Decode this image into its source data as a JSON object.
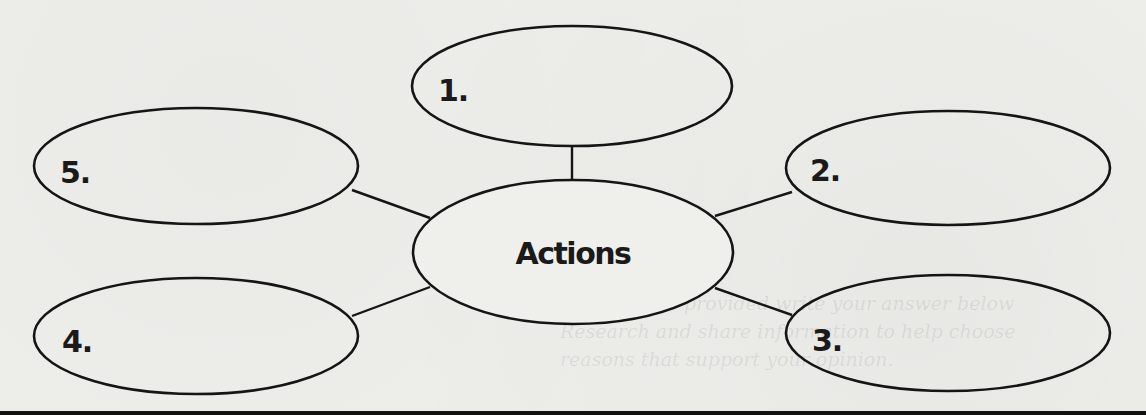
{
  "diagram": {
    "type": "concept-web",
    "center": {
      "label": "Actions",
      "cx": 573,
      "cy": 252,
      "rx": 160,
      "ry": 72
    },
    "nodes": [
      {
        "label": "1.",
        "cx": 572,
        "cy": 86,
        "rx": 160,
        "ry": 60
      },
      {
        "label": "2.",
        "cx": 948,
        "cy": 168,
        "rx": 162,
        "ry": 57
      },
      {
        "label": "3.",
        "cx": 948,
        "cy": 333,
        "rx": 162,
        "ry": 58
      },
      {
        "label": "4.",
        "cx": 196,
        "cy": 336,
        "rx": 162,
        "ry": 58
      },
      {
        "label": "5.",
        "cx": 196,
        "cy": 166,
        "rx": 162,
        "ry": 58
      }
    ],
    "connectors": [
      {
        "from": "1.",
        "to": "Actions"
      },
      {
        "from": "2.",
        "to": "Actions"
      },
      {
        "from": "3.",
        "to": "Actions"
      },
      {
        "from": "4.",
        "to": "Actions"
      },
      {
        "from": "5.",
        "to": "Actions"
      }
    ]
  },
  "colors": {
    "background": "#efefec",
    "stroke": "#151515",
    "text": "#1a1a1a"
  }
}
